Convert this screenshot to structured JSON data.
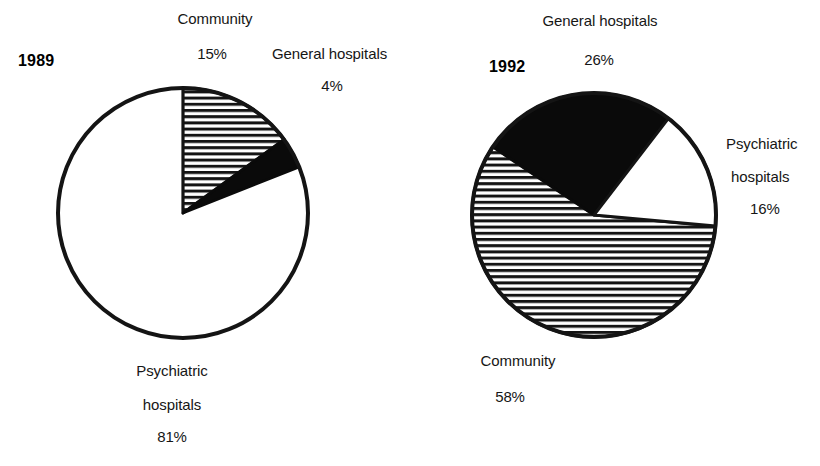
{
  "figure": {
    "width": 820,
    "height": 466,
    "background": "#ffffff",
    "fill_colors": {
      "striped": "#ffffff",
      "striped_lines": "#111111",
      "black": "#080808",
      "white": "#ffffff",
      "outline": "#111111"
    }
  },
  "chart_data": [
    {
      "type": "pie",
      "title": "1989",
      "labels": [
        "Community",
        "General hospitals",
        "Psychiatric hospitals"
      ],
      "values": [
        15,
        4,
        81
      ],
      "value_labels": [
        "15%",
        "4%",
        "81%"
      ],
      "fills": [
        "striped",
        "black",
        "white"
      ],
      "start_angle_deg": 0,
      "direction": "clockwise",
      "center": {
        "x": 183,
        "y": 213
      },
      "radius": 125,
      "legend": "none",
      "grid": false
    },
    {
      "type": "pie",
      "title": "1992",
      "labels": [
        "General hospitals",
        "Psychiatric hospitals",
        "Community"
      ],
      "values": [
        26,
        16,
        58
      ],
      "value_labels": [
        "26%",
        "16%",
        "58%"
      ],
      "fills": [
        "black",
        "white",
        "striped"
      ],
      "start_angle_deg": -56,
      "direction": "clockwise",
      "center": {
        "x": 594,
        "y": 215
      },
      "radius": 122,
      "legend": "none",
      "grid": false
    }
  ],
  "chart1": {
    "year": "1989",
    "community_label": "Community",
    "community_pct": "15%",
    "general_label": "General hospitals",
    "general_pct": "4%",
    "psych_label_line1": "Psychiatric",
    "psych_label_line2": "hospitals",
    "psych_pct": "81%"
  },
  "chart2": {
    "year": "1992",
    "general_label": "General hospitals",
    "general_pct": "26%",
    "psych_label_line1": "Psychiatric",
    "psych_label_line2": "hospitals",
    "psych_pct": "16%",
    "community_label": "Community",
    "community_pct": "58%"
  }
}
